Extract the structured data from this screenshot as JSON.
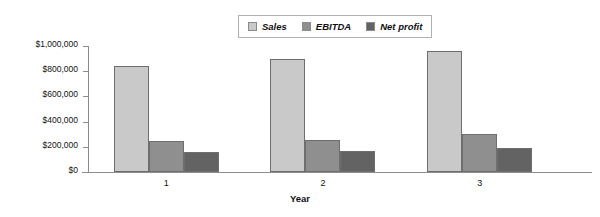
{
  "chart_data": {
    "type": "bar",
    "title": "",
    "xlabel": "Year",
    "ylabel": "",
    "categories": [
      "1",
      "2",
      "3"
    ],
    "series": [
      {
        "name": "Sales",
        "color": "#c9c9c9",
        "values": [
          840000,
          900000,
          960000
        ]
      },
      {
        "name": "EBITDA",
        "color": "#8f8f8f",
        "values": [
          245000,
          255000,
          300000
        ]
      },
      {
        "name": "Net profit",
        "color": "#636363",
        "values": [
          160000,
          170000,
          190000
        ]
      }
    ],
    "ylim": [
      0,
      1000000
    ],
    "ytick_labels": [
      "$1,000,000",
      "$800,000",
      "$600,000",
      "$400,000",
      "$200,000",
      "$0"
    ],
    "ytick_values": [
      1000000,
      800000,
      600000,
      400000,
      200000,
      0
    ],
    "grid": false,
    "legend_position": "top-center"
  },
  "legend": {
    "entries": [
      {
        "label": "Sales"
      },
      {
        "label": "EBITDA"
      },
      {
        "label": "Net profit"
      }
    ]
  },
  "axis": {
    "x_title": "Year"
  }
}
